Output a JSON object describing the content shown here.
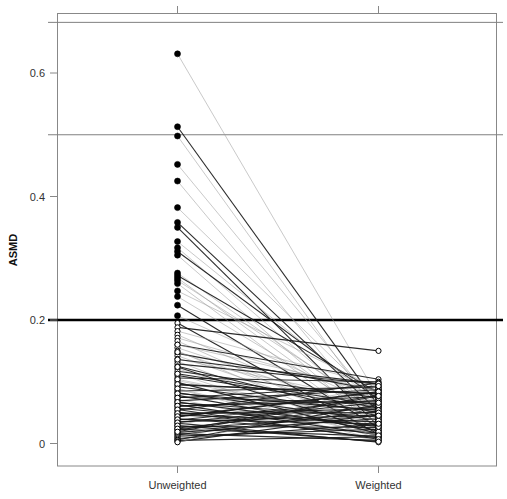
{
  "chart_data": {
    "type": "line",
    "title": "",
    "subtitle": "",
    "xlabel": "",
    "ylabel": "ASMD",
    "categories": [
      "Unweighted",
      "Weighted"
    ],
    "x_tick_labels": [
      "Unweighted",
      "Weighted"
    ],
    "y_tick_labels": [
      "0",
      "0.2",
      "0.4",
      "0.6"
    ],
    "y_tick_values": [
      0,
      0.2,
      0.4,
      0.6
    ],
    "ylim": [
      -0.02,
      0.71
    ],
    "xlim": [
      0.5,
      2.5
    ],
    "grid": false,
    "legend": "none",
    "reference_lines": [
      {
        "name": "threshold-0.2",
        "value": 0.2,
        "color": "#000000",
        "width": 2.6
      },
      {
        "name": "reference-0.5",
        "value": 0.5,
        "color": "#808080",
        "width": 1
      },
      {
        "name": "reference-0.68",
        "value": 0.682,
        "color": "#808080",
        "width": 1
      }
    ],
    "point_styles": {
      "above_threshold": "filled-circle",
      "below_threshold": "open-circle"
    },
    "series_note": "Each line connects one covariate's ASMD before (Unweighted) and after (Weighted) weighting.",
    "series": [
      {
        "name": "cov-01",
        "values": [
          0.631,
          0.074
        ]
      },
      {
        "name": "cov-02",
        "values": [
          0.513,
          0.061
        ]
      },
      {
        "name": "cov-03",
        "values": [
          0.498,
          0.045
        ]
      },
      {
        "name": "cov-04",
        "values": [
          0.452,
          0.058
        ]
      },
      {
        "name": "cov-05",
        "values": [
          0.425,
          0.034
        ]
      },
      {
        "name": "cov-06",
        "values": [
          0.382,
          0.067
        ]
      },
      {
        "name": "cov-07",
        "values": [
          0.358,
          0.052
        ]
      },
      {
        "name": "cov-08",
        "values": [
          0.35,
          0.028
        ]
      },
      {
        "name": "cov-09",
        "values": [
          0.327,
          0.064
        ]
      },
      {
        "name": "cov-10",
        "values": [
          0.317,
          0.039
        ]
      },
      {
        "name": "cov-11",
        "values": [
          0.311,
          0.071
        ]
      },
      {
        "name": "cov-12",
        "values": [
          0.305,
          0.022
        ]
      },
      {
        "name": "cov-13",
        "values": [
          0.276,
          0.049
        ]
      },
      {
        "name": "cov-14",
        "values": [
          0.272,
          0.082
        ]
      },
      {
        "name": "cov-15",
        "values": [
          0.268,
          0.031
        ]
      },
      {
        "name": "cov-16",
        "values": [
          0.264,
          0.055
        ]
      },
      {
        "name": "cov-17",
        "values": [
          0.259,
          0.018
        ]
      },
      {
        "name": "cov-18",
        "values": [
          0.247,
          0.088
        ]
      },
      {
        "name": "cov-19",
        "values": [
          0.238,
          0.042
        ]
      },
      {
        "name": "cov-20",
        "values": [
          0.224,
          0.026
        ]
      },
      {
        "name": "cov-21",
        "values": [
          0.207,
          0.061
        ]
      },
      {
        "name": "cov-22",
        "values": [
          0.195,
          0.015
        ]
      },
      {
        "name": "cov-23",
        "values": [
          0.188,
          0.15
        ]
      },
      {
        "name": "cov-24",
        "values": [
          0.182,
          0.094
        ]
      },
      {
        "name": "cov-25",
        "values": [
          0.176,
          0.036
        ]
      },
      {
        "name": "cov-26",
        "values": [
          0.171,
          0.078
        ]
      },
      {
        "name": "cov-27",
        "values": [
          0.166,
          0.02
        ]
      },
      {
        "name": "cov-28",
        "values": [
          0.16,
          0.104
        ]
      },
      {
        "name": "cov-29",
        "values": [
          0.155,
          0.048
        ]
      },
      {
        "name": "cov-30",
        "values": [
          0.15,
          0.012
        ]
      },
      {
        "name": "cov-31",
        "values": [
          0.146,
          0.086
        ]
      },
      {
        "name": "cov-32",
        "values": [
          0.142,
          0.03
        ]
      },
      {
        "name": "cov-33",
        "values": [
          0.137,
          0.068
        ]
      },
      {
        "name": "cov-34",
        "values": [
          0.133,
          0.01
        ]
      },
      {
        "name": "cov-35",
        "values": [
          0.129,
          0.096
        ]
      },
      {
        "name": "cov-36",
        "values": [
          0.125,
          0.044
        ]
      },
      {
        "name": "cov-37",
        "values": [
          0.121,
          0.024
        ]
      },
      {
        "name": "cov-38",
        "values": [
          0.117,
          0.074
        ]
      },
      {
        "name": "cov-39",
        "values": [
          0.113,
          0.008
        ]
      },
      {
        "name": "cov-40",
        "values": [
          0.11,
          0.058
        ]
      },
      {
        "name": "cov-41",
        "values": [
          0.106,
          0.1
        ]
      },
      {
        "name": "cov-42",
        "values": [
          0.102,
          0.033
        ]
      },
      {
        "name": "cov-43",
        "values": [
          0.099,
          0.016
        ]
      },
      {
        "name": "cov-44",
        "values": [
          0.095,
          0.081
        ]
      },
      {
        "name": "cov-45",
        "values": [
          0.092,
          0.051
        ]
      },
      {
        "name": "cov-46",
        "values": [
          0.088,
          0.006
        ]
      },
      {
        "name": "cov-47",
        "values": [
          0.085,
          0.091
        ]
      },
      {
        "name": "cov-48",
        "values": [
          0.082,
          0.038
        ]
      },
      {
        "name": "cov-49",
        "values": [
          0.078,
          0.021
        ]
      },
      {
        "name": "cov-50",
        "values": [
          0.075,
          0.065
        ]
      },
      {
        "name": "cov-51",
        "values": [
          0.072,
          0.004
        ]
      },
      {
        "name": "cov-52",
        "values": [
          0.069,
          0.087
        ]
      },
      {
        "name": "cov-53",
        "values": [
          0.066,
          0.043
        ]
      },
      {
        "name": "cov-54",
        "values": [
          0.063,
          0.014
        ]
      },
      {
        "name": "cov-55",
        "values": [
          0.06,
          0.076
        ]
      },
      {
        "name": "cov-56",
        "values": [
          0.057,
          0.029
        ]
      },
      {
        "name": "cov-57",
        "values": [
          0.054,
          0.098
        ]
      },
      {
        "name": "cov-58",
        "values": [
          0.051,
          0.009
        ]
      },
      {
        "name": "cov-59",
        "values": [
          0.048,
          0.056
        ]
      },
      {
        "name": "cov-60",
        "values": [
          0.046,
          0.035
        ]
      },
      {
        "name": "cov-61",
        "values": [
          0.043,
          0.083
        ]
      },
      {
        "name": "cov-62",
        "values": [
          0.04,
          0.017
        ]
      },
      {
        "name": "cov-63",
        "values": [
          0.038,
          0.07
        ]
      },
      {
        "name": "cov-64",
        "values": [
          0.035,
          0.046
        ]
      },
      {
        "name": "cov-65",
        "values": [
          0.033,
          0.002
        ]
      },
      {
        "name": "cov-66",
        "values": [
          0.03,
          0.092
        ]
      },
      {
        "name": "cov-67",
        "values": [
          0.028,
          0.026
        ]
      },
      {
        "name": "cov-68",
        "values": [
          0.025,
          0.06
        ]
      },
      {
        "name": "cov-69",
        "values": [
          0.023,
          0.012
        ]
      },
      {
        "name": "cov-70",
        "values": [
          0.021,
          0.079
        ]
      },
      {
        "name": "cov-71",
        "values": [
          0.018,
          0.04
        ]
      },
      {
        "name": "cov-72",
        "values": [
          0.016,
          0.005
        ]
      },
      {
        "name": "cov-73",
        "values": [
          0.014,
          0.053
        ]
      },
      {
        "name": "cov-74",
        "values": [
          0.012,
          0.023
        ]
      },
      {
        "name": "cov-75",
        "values": [
          0.01,
          0.089
        ]
      },
      {
        "name": "cov-76",
        "values": [
          0.008,
          0.031
        ]
      },
      {
        "name": "cov-77",
        "values": [
          0.006,
          0.063
        ]
      },
      {
        "name": "cov-78",
        "values": [
          0.005,
          0.011
        ]
      },
      {
        "name": "cov-79",
        "values": [
          0.003,
          0.047
        ]
      },
      {
        "name": "cov-80",
        "values": [
          0.002,
          0.072
        ]
      },
      {
        "name": "cov-81",
        "values": [
          0.16,
          0.085
        ]
      },
      {
        "name": "cov-82",
        "values": [
          0.148,
          0.041
        ]
      },
      {
        "name": "cov-83",
        "values": [
          0.136,
          0.097
        ]
      },
      {
        "name": "cov-84",
        "values": [
          0.124,
          0.019
        ]
      },
      {
        "name": "cov-85",
        "values": [
          0.113,
          0.062
        ]
      },
      {
        "name": "cov-86",
        "values": [
          0.104,
          0.037
        ]
      },
      {
        "name": "cov-87",
        "values": [
          0.096,
          0.08
        ]
      },
      {
        "name": "cov-88",
        "values": [
          0.089,
          0.013
        ]
      },
      {
        "name": "cov-89",
        "values": [
          0.081,
          0.054
        ]
      },
      {
        "name": "cov-90",
        "values": [
          0.074,
          0.093
        ]
      },
      {
        "name": "cov-91",
        "values": [
          0.067,
          0.027
        ]
      },
      {
        "name": "cov-92",
        "values": [
          0.061,
          0.069
        ]
      },
      {
        "name": "cov-93",
        "values": [
          0.055,
          0.007
        ]
      },
      {
        "name": "cov-94",
        "values": [
          0.049,
          0.05
        ]
      },
      {
        "name": "cov-95",
        "values": [
          0.044,
          0.084
        ]
      },
      {
        "name": "cov-96",
        "values": [
          0.039,
          0.032
        ]
      },
      {
        "name": "cov-97",
        "values": [
          0.034,
          0.066
        ]
      },
      {
        "name": "cov-98",
        "values": [
          0.029,
          0.003
        ]
      },
      {
        "name": "cov-99",
        "values": [
          0.024,
          0.045
        ]
      },
      {
        "name": "cov-100",
        "values": [
          0.019,
          0.077
        ]
      }
    ]
  }
}
